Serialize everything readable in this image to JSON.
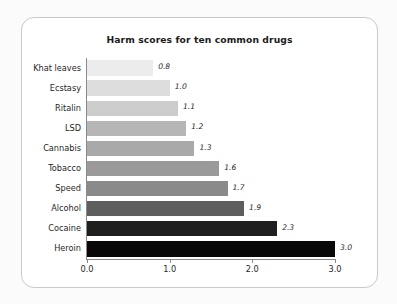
{
  "chart_data": {
    "type": "bar",
    "orientation": "horizontal",
    "title": "Harm scores for ten common drugs",
    "xlabel": "",
    "ylabel": "",
    "categories": [
      "Khat leaves",
      "Ecstasy",
      "Ritalin",
      "LSD",
      "Cannabis",
      "Tobacco",
      "Speed",
      "Alcohol",
      "Cocaine",
      "Heroin"
    ],
    "values": [
      0.8,
      1.0,
      1.1,
      1.2,
      1.3,
      1.6,
      1.7,
      1.9,
      2.3,
      3.0
    ],
    "value_labels": [
      "0.8",
      "1.0",
      "1.1",
      "1.2",
      "1.3",
      "1.6",
      "1.7",
      "1.9",
      "2.3",
      "3.0"
    ],
    "bar_colors": [
      "#ececec",
      "#dddddd",
      "#cccccc",
      "#b6b6b6",
      "#a9a9a9",
      "#9a9a9a",
      "#8a8a8a",
      "#5e5e5e",
      "#1f1f1f",
      "#080808"
    ],
    "xlim": [
      0.0,
      3.0
    ],
    "xticks": [
      0.0,
      1.0,
      2.0,
      3.0
    ],
    "xtick_labels": [
      "0.0",
      "1.0",
      "2.0",
      "3.0"
    ],
    "grid": false,
    "legend": null,
    "frame": {
      "border_color": "#c9c9c9",
      "background": "#ffffff",
      "rounded": true
    },
    "axis_color": "#8a8a8a"
  }
}
